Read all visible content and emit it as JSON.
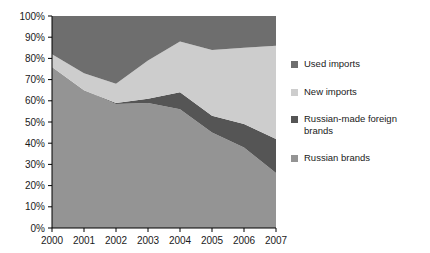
{
  "chart_data": {
    "type": "area",
    "stacked": true,
    "title": "",
    "subtitle": "",
    "xlabel": "",
    "ylabel": "",
    "categories": [
      "2000",
      "2001",
      "2002",
      "2003",
      "2004",
      "2005",
      "2006",
      "2007"
    ],
    "x": [
      2000,
      2001,
      2002,
      2003,
      2004,
      2005,
      2006,
      2007
    ],
    "ylim": [
      0,
      100
    ],
    "xlim": [
      2000,
      2007
    ],
    "y_tick_labels": [
      "0%",
      "10%",
      "20%",
      "30%",
      "40%",
      "50%",
      "60%",
      "70%",
      "80%",
      "90%",
      "100%"
    ],
    "y_tick_values": [
      0,
      10,
      20,
      30,
      40,
      50,
      60,
      70,
      80,
      90,
      100
    ],
    "grid": false,
    "legend_position": "right",
    "stack_order_bottom_to_top": [
      "Russian brands",
      "Russian-made foreign brands",
      "New imports",
      "Used imports"
    ],
    "series": [
      {
        "name": "Used imports",
        "color": "#6e6e6e",
        "values": [
          18,
          27,
          32,
          21,
          12,
          16,
          15,
          14
        ]
      },
      {
        "name": "New imports",
        "color": "#cdcdcd",
        "values": [
          6,
          8,
          9,
          18,
          24,
          31,
          36,
          44
        ]
      },
      {
        "name": "Russian-made foreign brands",
        "color": "#555555",
        "values": [
          0,
          0,
          0.5,
          2,
          8,
          8,
          11,
          16
        ]
      },
      {
        "name": "Russian brands",
        "color": "#949494",
        "values": [
          76,
          65,
          58.5,
          59,
          56,
          45,
          38,
          26
        ]
      }
    ],
    "cumulative_boundaries_bottom_to_top": {
      "russian_brands_top": [
        76,
        65,
        58.5,
        59,
        56,
        45,
        38,
        26
      ],
      "russian_made_foreign_top": [
        76,
        65,
        59,
        61,
        64,
        53,
        49,
        42
      ],
      "new_imports_top": [
        82,
        73,
        68,
        79,
        88,
        84,
        85,
        86
      ],
      "used_imports_top": [
        100,
        100,
        100,
        100,
        100,
        100,
        100,
        100
      ]
    }
  },
  "legend": {
    "items": [
      {
        "label": "Used imports",
        "color": "#6e6e6e"
      },
      {
        "label": "New imports",
        "color": "#cdcdcd"
      },
      {
        "label": "Russian-made foreign brands",
        "color": "#555555"
      },
      {
        "label": "Russian brands",
        "color": "#949494"
      }
    ]
  },
  "axis": {
    "y_labels": [
      "100%",
      "90%",
      "80%",
      "70%",
      "60%",
      "50%",
      "40%",
      "30%",
      "20%",
      "10%",
      "0%"
    ],
    "x_labels": [
      "2000",
      "2001",
      "2002",
      "2003",
      "2004",
      "2005",
      "2006",
      "2007"
    ]
  },
  "colors": {
    "background": "#ffffff",
    "axis_line": "#000000",
    "text": "#1a1a1a"
  }
}
